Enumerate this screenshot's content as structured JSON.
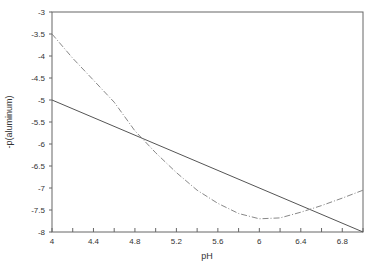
{
  "chart_data": {
    "type": "line",
    "title": "",
    "xlabel": "pH",
    "ylabel": "-p(aluminum)",
    "xlim": [
      4,
      7
    ],
    "ylim": [
      -8,
      -3
    ],
    "x_ticks": [
      4,
      4.4,
      4.8,
      5.2,
      5.6,
      6,
      6.4,
      6.8
    ],
    "x_tick_labels": [
      "4",
      "4.4",
      "4.8",
      "5.2",
      "5.6",
      "6",
      "6.4",
      "6.8"
    ],
    "x_minor_tick_step": 0.2,
    "y_ticks": [
      -3,
      -3.5,
      -4,
      -4.5,
      -5,
      -5.5,
      -6,
      -6.5,
      -7,
      -7.5,
      -8
    ],
    "y_tick_labels": [
      "-3",
      "-3.5",
      "-4",
      "-4.5",
      "-5",
      "-5.5",
      "-6",
      "-6.5",
      "-7",
      "-7.5",
      "-8"
    ],
    "grid": false,
    "legend": null,
    "series": [
      {
        "name": "solid line",
        "style": "solid",
        "color": "#555555",
        "x": [
          4.0,
          7.0
        ],
        "values": [
          -5.0,
          -8.0
        ]
      },
      {
        "name": "dashed curve",
        "style": "dashed",
        "color": "#888888",
        "x": [
          4.0,
          4.2,
          4.4,
          4.6,
          4.8,
          5.0,
          5.2,
          5.4,
          5.6,
          5.8,
          6.0,
          6.2,
          6.4,
          6.6,
          6.8,
          7.0
        ],
        "values": [
          -3.5,
          -4.05,
          -4.55,
          -5.05,
          -5.7,
          -6.2,
          -6.65,
          -7.05,
          -7.35,
          -7.58,
          -7.7,
          -7.68,
          -7.55,
          -7.4,
          -7.23,
          -7.05
        ]
      }
    ],
    "annotations": [
      {
        "label": "first intersection",
        "x": 4.85,
        "y": -5.85
      },
      {
        "label": "second intersection",
        "x": 6.5,
        "y": -7.5
      }
    ]
  }
}
